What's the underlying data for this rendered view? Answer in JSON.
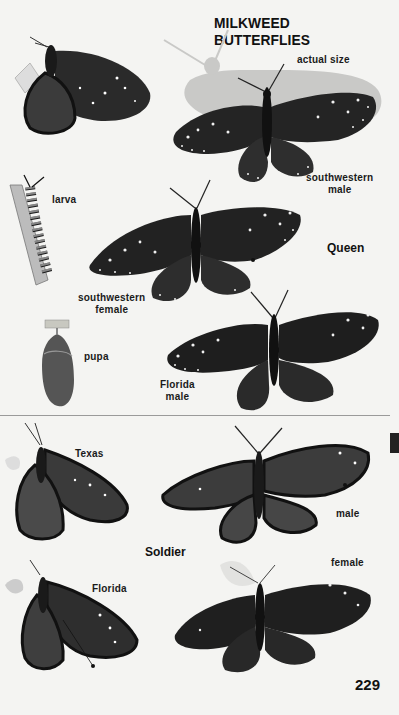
{
  "header": {
    "title": "MILKWEED BUTTERFLIES"
  },
  "queen": {
    "species_label": "Queen",
    "labels": {
      "actual_size": "actual size",
      "southwestern_male": [
        "southwestern",
        "male"
      ],
      "larva": "larva",
      "southwestern_female": [
        "southwestern",
        "female"
      ],
      "pupa": "pupa",
      "florida_male": [
        "Florida",
        "male"
      ]
    }
  },
  "soldier": {
    "species_label": "Soldier",
    "labels": {
      "texas": "Texas",
      "male": "male",
      "female": "female",
      "florida": "Florida"
    }
  },
  "page_number": "229",
  "colors": {
    "background": "#f4f4f2",
    "shadow": "#c9c9c7",
    "wing_dark": "#1c1c1c",
    "wing_mid": "#3a3a3a",
    "text": "#111111"
  }
}
